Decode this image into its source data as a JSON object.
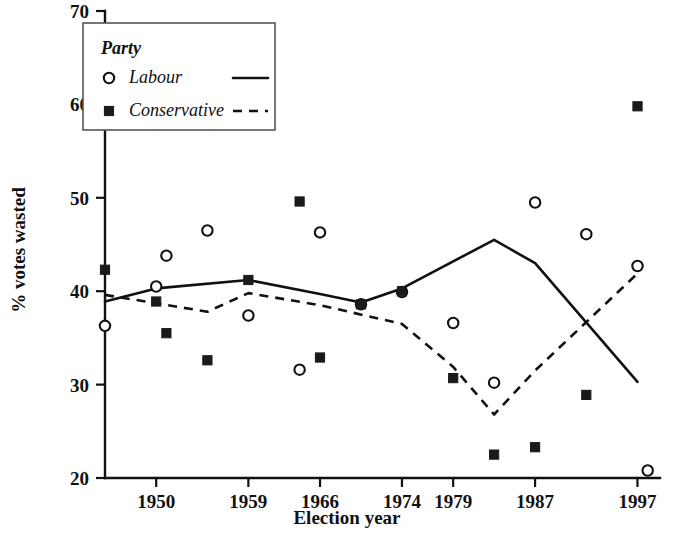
{
  "chart_data": {
    "type": "scatter",
    "title": "",
    "xlabel": "Election year",
    "ylabel": "% votes wasted",
    "xlim": [
      1945,
      2000
    ],
    "ylim": [
      20,
      70
    ],
    "yticks": [
      20,
      30,
      40,
      50,
      60,
      70
    ],
    "ytick_labels": [
      "20",
      "30",
      "40",
      "50",
      "60",
      "70"
    ],
    "xticks": [
      1950,
      1959,
      1966,
      1974,
      1979,
      1987,
      1997
    ],
    "xtick_labels": [
      "1950",
      "1959",
      "1966",
      "1974",
      "1979",
      "1987",
      "1997"
    ],
    "grid": false,
    "legend": {
      "position": "top-left",
      "title": "Party",
      "entries": [
        {
          "name": "Labour",
          "marker": "open-circle",
          "line": "solid"
        },
        {
          "name": "Conservative",
          "marker": "filled-square",
          "line": "dashed"
        }
      ]
    },
    "series": [
      {
        "name": "Labour",
        "marker": "open-circle",
        "line": "solid",
        "points": [
          {
            "x": 1945,
            "y": 36.3
          },
          {
            "x": 1950,
            "y": 40.5
          },
          {
            "x": 1951,
            "y": 43.8
          },
          {
            "x": 1955,
            "y": 46.5
          },
          {
            "x": 1959,
            "y": 37.4
          },
          {
            "x": 1964,
            "y": 31.6
          },
          {
            "x": 1966,
            "y": 46.3
          },
          {
            "x": 1970,
            "y": 38.6
          },
          {
            "x": 1974,
            "y": 39.9
          },
          {
            "x": 1979,
            "y": 36.6
          },
          {
            "x": 1983,
            "y": 30.2
          },
          {
            "x": 1987,
            "y": 49.5
          },
          {
            "x": 1992,
            "y": 46.1
          },
          {
            "x": 1997,
            "y": 42.7
          },
          {
            "x": 1998,
            "y": 20.8
          }
        ],
        "trend": [
          {
            "x": 1945,
            "y": 38.9
          },
          {
            "x": 1950,
            "y": 40.3
          },
          {
            "x": 1959,
            "y": 41.2
          },
          {
            "x": 1966,
            "y": 39.7
          },
          {
            "x": 1970,
            "y": 38.8
          },
          {
            "x": 1974,
            "y": 40.3
          },
          {
            "x": 1983,
            "y": 45.5
          },
          {
            "x": 1987,
            "y": 43.0
          },
          {
            "x": 1997,
            "y": 30.3
          }
        ]
      },
      {
        "name": "Conservative",
        "marker": "filled-square",
        "line": "dashed",
        "points": [
          {
            "x": 1945,
            "y": 42.3
          },
          {
            "x": 1950,
            "y": 38.9
          },
          {
            "x": 1951,
            "y": 35.5
          },
          {
            "x": 1955,
            "y": 32.6
          },
          {
            "x": 1959,
            "y": 41.2
          },
          {
            "x": 1964,
            "y": 49.6
          },
          {
            "x": 1966,
            "y": 32.9
          },
          {
            "x": 1970,
            "y": 38.6
          },
          {
            "x": 1974,
            "y": 40.0
          },
          {
            "x": 1979,
            "y": 30.7
          },
          {
            "x": 1983,
            "y": 22.5
          },
          {
            "x": 1987,
            "y": 23.3
          },
          {
            "x": 1992,
            "y": 28.9
          },
          {
            "x": 1997,
            "y": 59.8
          }
        ],
        "trend": [
          {
            "x": 1945,
            "y": 39.6
          },
          {
            "x": 1950,
            "y": 38.7
          },
          {
            "x": 1955,
            "y": 37.8
          },
          {
            "x": 1959,
            "y": 39.8
          },
          {
            "x": 1966,
            "y": 38.5
          },
          {
            "x": 1974,
            "y": 36.5
          },
          {
            "x": 1979,
            "y": 31.9
          },
          {
            "x": 1983,
            "y": 26.8
          },
          {
            "x": 1987,
            "y": 31.5
          },
          {
            "x": 1997,
            "y": 41.9
          }
        ]
      }
    ]
  }
}
